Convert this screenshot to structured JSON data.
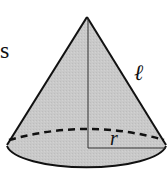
{
  "figure": {
    "type": "cone",
    "fill_color": "#c9c9c9",
    "stroke_color": "#111111",
    "labels": {
      "partial_text": "s",
      "slant_height": "ℓ",
      "radius": "r"
    },
    "geometry": {
      "apex": [
        87,
        17
      ],
      "base_center": [
        88,
        148
      ],
      "base_rx": 80,
      "base_ry": 24
    }
  }
}
